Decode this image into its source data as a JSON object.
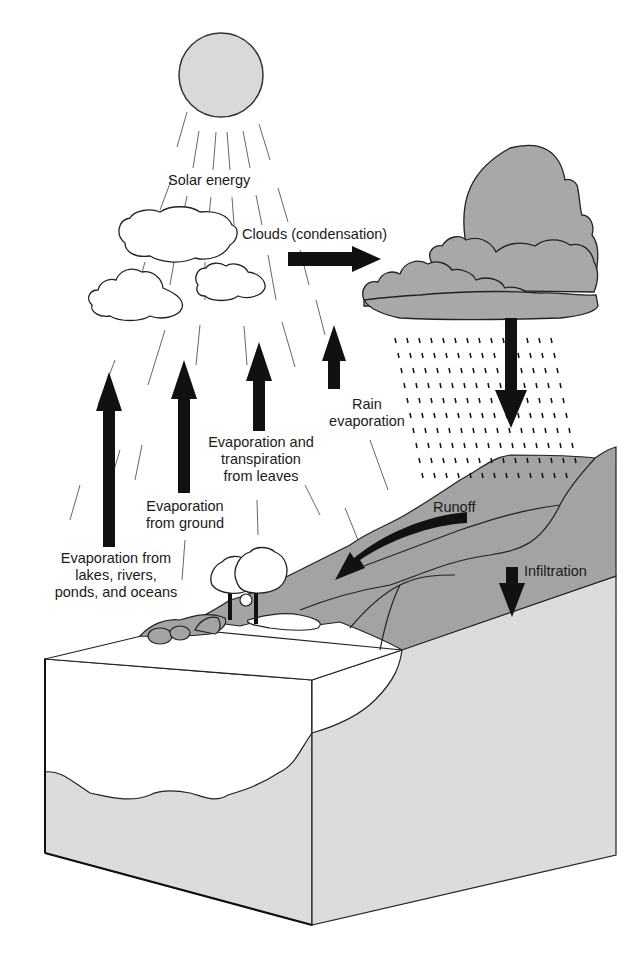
{
  "diagram": {
    "labels": {
      "solar_energy": "Solar energy",
      "clouds": "Clouds (condensation)",
      "rain_evaporation": "Rain\nevaporation",
      "evap_transpiration": "Evaporation and\ntranspiration\nfrom leaves",
      "evap_ground": "Evaporation\nfrom ground",
      "evap_water": "Evaporation from\nlakes, rivers,\nponds, and oceans",
      "runoff": "Runoff",
      "infiltration": "Infiltration"
    },
    "elements": [
      "sun",
      "white-clouds",
      "storm-cloud",
      "rain",
      "hill",
      "trees",
      "lake",
      "ground-block"
    ],
    "colors": {
      "sun": "#d9d9d9",
      "storm_cloud": "#a8a8a8",
      "hill": "#a3a3a3",
      "ground": "#dcdcdc",
      "arrow": "#111111",
      "outline": "#222222"
    }
  }
}
